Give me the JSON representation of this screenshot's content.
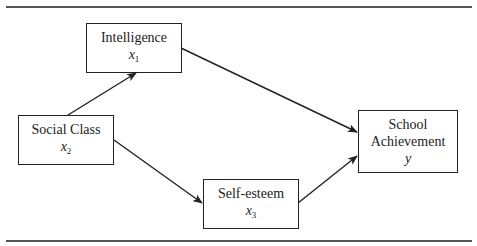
{
  "diagram": {
    "nodes": [
      {
        "id": "intelligence",
        "label": "Intelligence",
        "var": "x",
        "sub": "1"
      },
      {
        "id": "social_class",
        "label": "Social Class",
        "var": "x",
        "sub": "2"
      },
      {
        "id": "self_esteem",
        "label": "Self-esteem",
        "var": "x",
        "sub": "3"
      },
      {
        "id": "school_achievement",
        "label_line1": "School",
        "label_line2": "Achievement",
        "var": "y",
        "sub": ""
      }
    ],
    "edges": [
      {
        "from": "social_class",
        "to": "intelligence"
      },
      {
        "from": "social_class",
        "to": "self_esteem"
      },
      {
        "from": "intelligence",
        "to": "school_achievement"
      },
      {
        "from": "self_esteem",
        "to": "school_achievement"
      }
    ]
  }
}
